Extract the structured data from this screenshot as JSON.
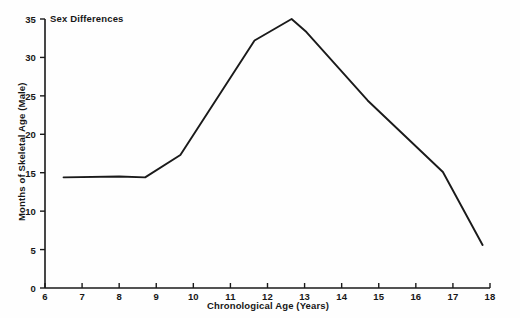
{
  "chart_data": {
    "type": "line",
    "title": "Sex Differences",
    "xlabel": "Chronological Age (Years)",
    "ylabel": "Months of Skeletal Age (Male)",
    "xlim": [
      6,
      18
    ],
    "ylim": [
      0,
      35
    ],
    "grid": false,
    "legend": "none",
    "xticks": [
      6,
      7,
      8,
      9,
      10,
      11,
      12,
      13,
      14,
      15,
      16,
      17,
      18
    ],
    "yticks": [
      0,
      5,
      10,
      15,
      20,
      25,
      30,
      35
    ],
    "xtick_labels": [
      "6",
      "7",
      "8",
      "9",
      "10",
      "11",
      "12",
      "13",
      "14",
      "15",
      "16",
      "17",
      "18"
    ],
    "ytick_labels": [
      "0",
      "5",
      "10",
      "15",
      "20",
      "25",
      "30",
      "35"
    ],
    "series": [
      {
        "name": "Sex Differences",
        "color": "#1a1a1a",
        "x": [
          6.5,
          8.0,
          8.7,
          9.65,
          11.65,
          12.65,
          13.05,
          14.7,
          16.73,
          17.8
        ],
        "y": [
          14.4,
          14.5,
          14.4,
          17.3,
          32.2,
          35.0,
          33.3,
          24.4,
          15.1,
          5.6
        ]
      }
    ]
  }
}
